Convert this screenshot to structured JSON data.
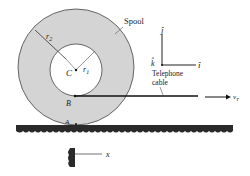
{
  "diagram": {
    "spool_label": "Spool",
    "center_label": "C",
    "inner_radius_label": "r",
    "inner_radius_sub": "1",
    "outer_radius_label": "r",
    "outer_radius_sub": "2",
    "point_b_label": "B",
    "point_a_label": "A",
    "cable_label_line1": "Telephone",
    "cable_label_line2": "cable",
    "velocity_label": "v",
    "velocity_sub": "T",
    "axis_j_label": "ĵ",
    "axis_i_label": "î",
    "axis_k_label": "k̂",
    "position_label": "x",
    "colors": {
      "spool_fill": "#d4d4d4",
      "line": "#222222",
      "ground": "#2a2a2a",
      "background": "#ffffff"
    }
  }
}
